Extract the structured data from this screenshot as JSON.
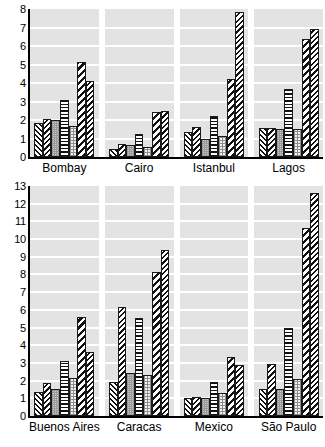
{
  "chart_data": [
    {
      "panel_id": "top",
      "type": "bar",
      "title": "",
      "xlabel": "",
      "ylabel": "",
      "ylim": [
        0,
        8
      ],
      "yticks": [
        0,
        1,
        2,
        3,
        4,
        5,
        6,
        7,
        8
      ],
      "ytick_labels": [
        "0",
        "1",
        "2",
        "3",
        "4",
        "5",
        "6",
        "7",
        "8"
      ],
      "grid": true,
      "grid_axis": "y",
      "legend": "none",
      "categories": [
        "Bombay",
        "Cairo",
        "Istanbul",
        "Lagos"
      ],
      "series": [
        {
          "name": "series-1",
          "pattern": "diagonal-back-dense",
          "values": [
            1.85,
            0.45,
            1.35,
            1.55
          ]
        },
        {
          "name": "series-2",
          "pattern": "diagonal-forward",
          "values": [
            2.05,
            0.7,
            1.6,
            1.55
          ]
        },
        {
          "name": "series-3",
          "pattern": "gray-checker",
          "values": [
            2.0,
            0.65,
            1.0,
            1.5
          ]
        },
        {
          "name": "series-4",
          "pattern": "horizontal-lines",
          "values": [
            3.1,
            1.25,
            2.2,
            3.65
          ]
        },
        {
          "name": "series-5",
          "pattern": "light-dotted",
          "values": [
            1.7,
            0.55,
            1.15,
            1.5
          ]
        },
        {
          "name": "series-6",
          "pattern": "diagonal-bold",
          "values": [
            5.15,
            2.45,
            4.2,
            6.4
          ]
        },
        {
          "name": "series-7",
          "pattern": "diagonal-forward",
          "values": [
            4.1,
            2.5,
            7.85,
            6.9
          ]
        }
      ]
    },
    {
      "panel_id": "bottom",
      "type": "bar",
      "title": "",
      "xlabel": "",
      "ylabel": "",
      "ylim": [
        0,
        13
      ],
      "yticks": [
        0,
        1,
        2,
        3,
        4,
        5,
        6,
        7,
        8,
        9,
        10,
        11,
        12,
        13
      ],
      "ytick_labels": [
        "0",
        "1",
        "2",
        "3",
        "4",
        "5",
        "6",
        "7",
        "8",
        "9",
        "10",
        "11",
        "12",
        "13"
      ],
      "grid": true,
      "grid_axis": "y",
      "legend": "none",
      "categories": [
        "Buenos Aires",
        "Caracas",
        "Mexico",
        "São Paulo"
      ],
      "series": [
        {
          "name": "series-1",
          "pattern": "diagonal-back-dense",
          "values": [
            1.35,
            1.9,
            1.0,
            1.5
          ]
        },
        {
          "name": "series-2",
          "pattern": "diagonal-forward",
          "values": [
            1.85,
            6.15,
            1.1,
            2.95
          ]
        },
        {
          "name": "series-3",
          "pattern": "gray-checker",
          "values": [
            1.5,
            2.45,
            1.0,
            1.5
          ]
        },
        {
          "name": "series-4",
          "pattern": "horizontal-lines",
          "values": [
            3.1,
            5.55,
            1.9,
            4.95
          ]
        },
        {
          "name": "series-5",
          "pattern": "light-dotted",
          "values": [
            2.15,
            2.3,
            1.3,
            2.1
          ]
        },
        {
          "name": "series-6",
          "pattern": "diagonal-bold",
          "values": [
            5.6,
            8.15,
            3.35,
            10.6
          ]
        },
        {
          "name": "series-7",
          "pattern": "diagonal-forward",
          "values": [
            3.6,
            9.4,
            2.9,
            12.6
          ]
        }
      ]
    }
  ],
  "style": {
    "plot_background": "#e3e3e3",
    "gridline_color": "#ffffff",
    "axis_color": "#000000",
    "bar_edge_color": "#1a1a1a"
  }
}
